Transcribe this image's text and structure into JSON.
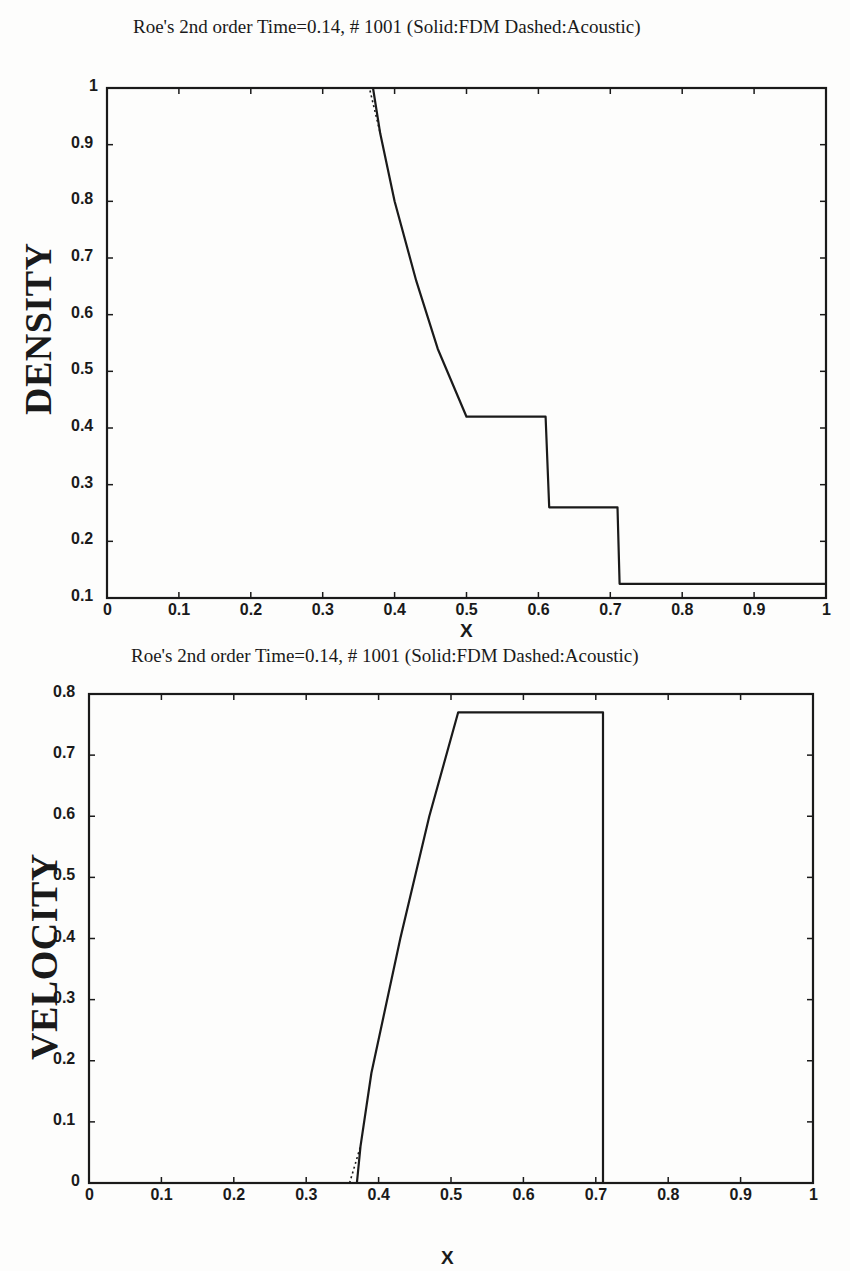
{
  "chart_data": [
    {
      "type": "line",
      "title": "Roe's 2nd order Time=0.14, # 1001 (Solid:FDM Dashed:Acoustic)",
      "xlabel": "X",
      "ylabel": "DENSITY",
      "xlim": [
        0,
        1
      ],
      "ylim": [
        0.1,
        1
      ],
      "xticks": [
        "0",
        "0.1",
        "0.2",
        "0.3",
        "0.4",
        "0.5",
        "0.6",
        "0.7",
        "0.8",
        "0.9",
        "1"
      ],
      "yticks": [
        "0.1",
        "0.2",
        "0.3",
        "0.4",
        "0.5",
        "0.6",
        "0.7",
        "0.8",
        "0.9",
        "1"
      ],
      "grid": false,
      "legend": "in title: Solid = FDM, Dashed = Acoustic",
      "series": [
        {
          "name": "FDM",
          "style": "solid",
          "x": [
            0,
            0.37,
            0.38,
            0.4,
            0.43,
            0.46,
            0.5,
            0.61,
            0.615,
            0.71,
            0.713,
            1.0
          ],
          "y": [
            1.0,
            1.0,
            0.92,
            0.8,
            0.66,
            0.54,
            0.42,
            0.42,
            0.26,
            0.26,
            0.125,
            0.125
          ]
        },
        {
          "name": "Acoustic",
          "style": "dashed",
          "x": [
            0,
            0.365,
            0.38
          ],
          "y": [
            1.0,
            1.0,
            0.92
          ]
        }
      ]
    },
    {
      "type": "line",
      "title": "Roe's 2nd order Time=0.14, # 1001 (Solid:FDM Dashed:Acoustic)",
      "xlabel": "X",
      "ylabel": "VELOCITY",
      "xlim": [
        0,
        1
      ],
      "ylim": [
        0,
        0.8
      ],
      "xticks": [
        "0",
        "0.1",
        "0.2",
        "0.3",
        "0.4",
        "0.5",
        "0.6",
        "0.7",
        "0.8",
        "0.9",
        "1"
      ],
      "yticks": [
        "0",
        "0.1",
        "0.2",
        "0.3",
        "0.4",
        "0.5",
        "0.6",
        "0.7",
        "0.8"
      ],
      "grid": false,
      "legend": "in title: Solid = FDM, Dashed = Acoustic",
      "series": [
        {
          "name": "FDM",
          "style": "solid",
          "x": [
            0,
            0.37,
            0.375,
            0.39,
            0.43,
            0.47,
            0.51,
            0.7,
            0.71,
            0.71,
            1.0
          ],
          "y": [
            0,
            0,
            0.06,
            0.18,
            0.4,
            0.6,
            0.77,
            0.77,
            0.77,
            0,
            0
          ]
        },
        {
          "name": "Acoustic",
          "style": "dashed",
          "x": [
            0.36,
            0.375
          ],
          "y": [
            0,
            0.06
          ]
        }
      ]
    }
  ],
  "top": {
    "title": "Roe's 2nd order Time=0.14, # 1001 (Solid:FDM Dashed:Acoustic)",
    "ylabel": "DENSITY",
    "xlabel": "X"
  },
  "bottom": {
    "title": "Roe's 2nd order Time=0.14, # 1001 (Solid:FDM Dashed:Acoustic)",
    "ylabel": "VELOCITY",
    "xlabel": "X"
  }
}
